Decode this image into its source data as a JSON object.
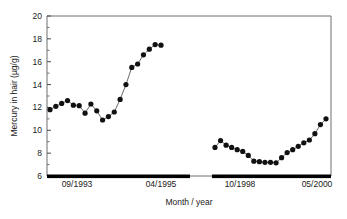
{
  "chart_data": {
    "type": "line",
    "title": "",
    "subtitle": "",
    "xlabel": "Month / year",
    "ylabel": "Mercury in hair (µg/g)",
    "ylim": [
      6,
      20
    ],
    "ytick_labels": [
      "6",
      "8",
      "10",
      "12",
      "14",
      "16",
      "18",
      "20"
    ],
    "ytick_values": [
      6,
      8,
      10,
      12,
      14,
      16,
      18,
      20
    ],
    "y_minor_interval": 1,
    "xtick_labels": [
      "09/1993",
      "04/1995",
      "10/1998",
      "05/2000"
    ],
    "grid": false,
    "legend": false,
    "legend_position": "none",
    "marker": "filled-circle",
    "series": [
      {
        "name": "Sampling period 1 (09/1993 - 04/1995)",
        "x_start_label": "09/1993",
        "x_end_label": "04/1995",
        "values": [
          11.8,
          12.1,
          12.35,
          12.6,
          12.2,
          12.15,
          11.5,
          12.3,
          11.7,
          10.9,
          11.2,
          11.6,
          12.7,
          14.0,
          15.5,
          15.8,
          16.6,
          17.1,
          17.5,
          17.45
        ]
      },
      {
        "name": "Sampling period 2 (10/1998 - 05/2000)",
        "x_start_label": "10/1998",
        "x_end_label": "05/2000",
        "values": [
          8.5,
          9.1,
          8.7,
          8.5,
          8.3,
          8.15,
          7.8,
          7.3,
          7.25,
          7.2,
          7.2,
          7.15,
          7.6,
          8.05,
          8.3,
          8.6,
          8.9,
          9.15,
          9.7,
          10.5,
          11.0
        ]
      }
    ],
    "sampling_bars": [
      {
        "label": "09/1993 - 04/1995"
      },
      {
        "label": "10/1998 - 05/2000"
      }
    ],
    "colors": {
      "marker": "#111111",
      "line": "#6b6b6b",
      "frame": "#6e6e6e",
      "sample_bar": "#000000",
      "background": "#ffffff",
      "text": "#1a1a1a"
    }
  }
}
